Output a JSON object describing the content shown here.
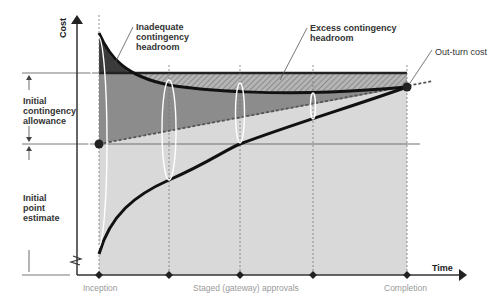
{
  "diagram": {
    "type": "cost-estimate-convergence",
    "axes": {
      "y_label": "Cost",
      "x_label": "Time"
    },
    "x_ticks": [
      {
        "label": "Inception",
        "x": 99
      },
      {
        "label": "",
        "x": 169
      },
      {
        "label": "Staged (gateway) approvals",
        "x": 240
      },
      {
        "label": "",
        "x": 313
      },
      {
        "label": "Completion",
        "x": 407
      }
    ],
    "left_annotations": {
      "initial_contingency_allowance": "Initial\ncontingency\nallowance",
      "initial_point_estimate": "Initial\npoint\nestimate"
    },
    "callouts": {
      "inadequate": "Inadequate contingency headroom",
      "inadequate_lines": [
        "Inadequate",
        "contingency",
        "headroom"
      ],
      "excess": "Excess contingency headroom",
      "excess_lines": [
        "Excess contingency",
        "headroom"
      ],
      "out_turn": "Out-turn cost"
    },
    "colors": {
      "dark_fill": "#3a3a3a",
      "mid_fill": "#8c8c8c",
      "light_fill": "#d9d9d9",
      "hatch": "#a8a8a8",
      "curve": "#111111",
      "label_grey": "#9a9a9a"
    }
  }
}
